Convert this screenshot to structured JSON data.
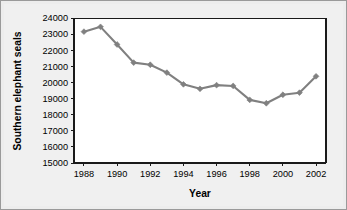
{
  "chart_data": {
    "type": "line",
    "title": "",
    "xlabel": "Year",
    "ylabel": "Southern elephant seals",
    "x": [
      1988,
      1989,
      1990,
      1991,
      1992,
      1993,
      1994,
      1995,
      1996,
      1997,
      1998,
      1999,
      2000,
      2001,
      2002
    ],
    "values": [
      23180,
      23480,
      22380,
      21250,
      21120,
      20630,
      19900,
      19620,
      19850,
      19800,
      18930,
      18720,
      19250,
      19380,
      20400
    ],
    "series": [
      {
        "name": "Southern elephant seals",
        "values": [
          23180,
          23480,
          22380,
          21250,
          21120,
          20630,
          19900,
          19620,
          19850,
          19800,
          18930,
          18720,
          19250,
          19380,
          20400
        ]
      }
    ],
    "xlim": [
      1987.4,
      2002.6
    ],
    "ylim": [
      15000,
      24000
    ],
    "xticks": [
      1988,
      1990,
      1992,
      1994,
      1996,
      1998,
      2000,
      2002
    ],
    "xtick_labels": [
      "1988",
      "1990",
      "1992",
      "1994",
      "1996",
      "1998",
      "2000",
      "2002"
    ],
    "yticks": [
      15000,
      16000,
      17000,
      18000,
      19000,
      20000,
      21000,
      22000,
      23000,
      24000
    ],
    "ytick_labels": [
      "15000",
      "16000",
      "17000",
      "18000",
      "19000",
      "20000",
      "21000",
      "22000",
      "23000",
      "24000"
    ],
    "grid": false,
    "legend": false,
    "legend_position": "none",
    "marker": "diamond",
    "colors": {
      "series": "#808080",
      "axis": "#1a1a1a",
      "plot_background": "#ffffff",
      "figure_background": "#efefef",
      "figure_border": "#9a9a9a",
      "text": "#000000"
    }
  }
}
